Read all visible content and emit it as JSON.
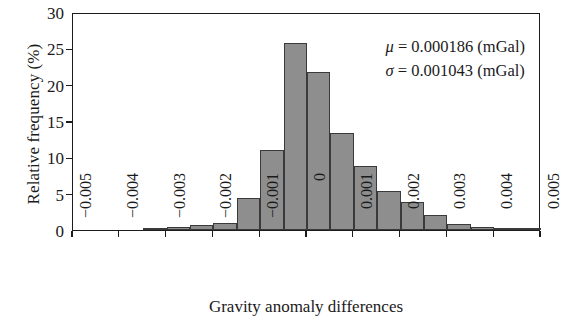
{
  "chart_data": {
    "type": "bar",
    "title": "",
    "subtitle": "",
    "xlabel": "Gravity anomaly differences",
    "ylabel": "Relative frequency (%)",
    "xlim": [
      -0.005,
      0.005
    ],
    "ylim": [
      0,
      30
    ],
    "grid": false,
    "legend": null,
    "bin_width": 0.0005,
    "x_tick_labels": [
      "−0.005",
      "−0.004",
      "−0.003",
      "−0.002",
      "−0.001",
      "0",
      "0.001",
      "0.002",
      "0.003",
      "0.004",
      "0.005"
    ],
    "x_tick_values": [
      -0.005,
      -0.004,
      -0.003,
      -0.002,
      -0.001,
      0,
      0.001,
      0.002,
      0.003,
      0.004,
      0.005
    ],
    "y_tick_labels": [
      "0",
      "5",
      "10",
      "15",
      "20",
      "25",
      "30"
    ],
    "y_tick_values": [
      0,
      5,
      10,
      15,
      20,
      25,
      30
    ],
    "bin_left_edges": [
      -0.005,
      -0.0045,
      -0.004,
      -0.0035,
      -0.003,
      -0.0025,
      -0.002,
      -0.0015,
      -0.001,
      -0.0005,
      0.0,
      0.0005,
      0.001,
      0.0015,
      0.002,
      0.0025,
      0.003,
      0.0035,
      0.004,
      0.0045
    ],
    "values": [
      0.0,
      0.0,
      0.0,
      0.2,
      0.4,
      0.7,
      1.0,
      4.4,
      11.0,
      25.8,
      21.8,
      13.4,
      8.8,
      5.4,
      3.9,
      2.0,
      0.8,
      0.4,
      0.3,
      0.3
    ],
    "bar_color": "#8e8e8e",
    "bar_edge_color": "#3a3a3a",
    "annotations": [
      {
        "symbol": "μ",
        "equals": "=",
        "value": "0.000186",
        "units": "(mGal)"
      },
      {
        "symbol": "σ",
        "equals": "=",
        "value": "0.001043",
        "units": "(mGal)"
      }
    ]
  },
  "figure": {
    "background": "#ffffff",
    "frame_color": "#1c1c1c"
  }
}
